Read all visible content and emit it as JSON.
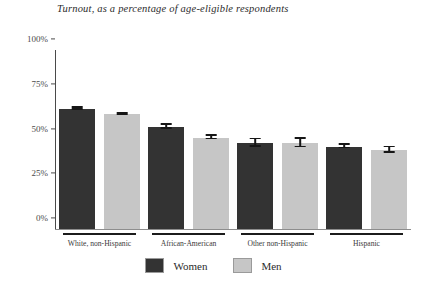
{
  "chart_data": {
    "type": "bar",
    "title": "Turnout, as a percentage of age-eligible respondents",
    "xlabel": "",
    "ylabel": "",
    "ylim": [
      0,
      100
    ],
    "yticks": [
      "0%",
      "25%",
      "50%",
      "75%",
      "100%"
    ],
    "ytick_values": [
      0,
      25,
      50,
      75,
      100
    ],
    "grid": false,
    "legend_position": "bottom-center",
    "categories": [
      "White, non-Hispanic",
      "African-American",
      "Other non-Hispanic",
      "Hispanic"
    ],
    "series": [
      {
        "name": "Women",
        "color": "#333333",
        "values": [
          67,
          57,
          48,
          46
        ],
        "errors": [
          1.0,
          1.5,
          2.5,
          1.5
        ]
      },
      {
        "name": "Men",
        "color": "#c6c6c6",
        "values": [
          64,
          51,
          48,
          44
        ],
        "errors": [
          1.0,
          1.5,
          3.0,
          2.0
        ]
      }
    ]
  },
  "legend": {
    "items": [
      {
        "label": "Women"
      },
      {
        "label": "Men"
      }
    ]
  }
}
